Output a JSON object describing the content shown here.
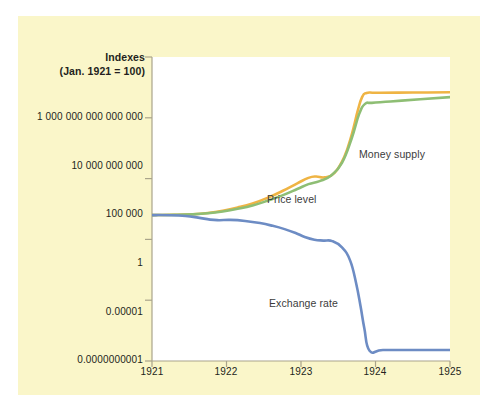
{
  "figure": {
    "background_color": "#ffffff",
    "panel_color": "#faf6c9",
    "plot_color": "#ffffff"
  },
  "axis_title": {
    "line1": "Indexes",
    "line2": "(Jan. 1921 = 100)"
  },
  "chart_data": {
    "type": "line",
    "title": "Indexes (Jan. 1921 = 100)",
    "xlabel": "",
    "ylabel": "Indexes (Jan. 1921 = 100)",
    "yscale": "log",
    "grid": false,
    "legend": "inline-annotations",
    "xlim": [
      1921,
      1925
    ],
    "ylim": [
      1e-10,
      1000000000000000.0
    ],
    "xticks": [
      1921,
      1922,
      1923,
      1924,
      1925
    ],
    "xtick_labels": [
      "1921",
      "1922",
      "1923",
      "1924",
      "1925"
    ],
    "yticks": [
      1000000000000000.0,
      10000000000.0,
      100000.0,
      1,
      1e-05,
      1e-10
    ],
    "ytick_labels": [
      "1 000 000 000 000 000",
      "10 000 000 000",
      "100 000",
      "1",
      "0.00001",
      "0.0000000001"
    ],
    "series": [
      {
        "name": "Price level",
        "color": "#efb444",
        "x": [
          1921.0,
          1921.3,
          1921.55,
          1921.75,
          1921.95,
          1922.15,
          1922.35,
          1922.55,
          1922.75,
          1922.95,
          1923.1,
          1923.2,
          1923.32,
          1923.45,
          1923.58,
          1923.68,
          1923.76,
          1923.82,
          1923.88,
          1924.0,
          1924.3,
          1924.7,
          1925.0
        ],
        "values": [
          100,
          105,
          118,
          150,
          230,
          420,
          900,
          2600,
          9500,
          41000,
          115000,
          150000,
          128000,
          300000,
          6000000.0,
          400000000.0,
          35000000000.0,
          500000000000.0,
          1100000000000.0,
          1150000000000.0,
          1180000000000.0,
          1200000000000.0,
          1250000000000.0
        ]
      },
      {
        "name": "Money supply",
        "color": "#8ebe74",
        "x": [
          1921.0,
          1921.3,
          1921.55,
          1921.75,
          1921.95,
          1922.15,
          1922.35,
          1922.55,
          1922.75,
          1922.95,
          1923.1,
          1923.25,
          1923.4,
          1923.55,
          1923.68,
          1923.78,
          1923.86,
          1923.95,
          1924.2,
          1924.6,
          1925.0
        ],
        "values": [
          100,
          104,
          115,
          140,
          200,
          330,
          620,
          1500,
          4200,
          14000,
          35000,
          62000,
          170000,
          2000000.0,
          200000000.0,
          20000000000.0,
          140000000000.0,
          170000000000.0,
          220000000000.0,
          340000000000.0,
          500000000000.0
        ]
      },
      {
        "name": "Exchange rate",
        "color": "#6d8cc4",
        "x": [
          1921.0,
          1921.25,
          1921.45,
          1921.62,
          1921.78,
          1921.9,
          1922.05,
          1922.25,
          1922.45,
          1922.62,
          1922.78,
          1922.92,
          1923.05,
          1923.18,
          1923.3,
          1923.42,
          1923.55,
          1923.66,
          1923.74,
          1923.8,
          1923.85,
          1923.92,
          1924.1,
          1924.5,
          1925.0
        ],
        "values": [
          100,
          98,
          85,
          62,
          42,
          38,
          40,
          33,
          22,
          13,
          7.0,
          3.5,
          1.6,
          0.95,
          0.8,
          0.72,
          0.22,
          0.018,
          0.00025,
          3e-06,
          5e-08,
          7e-10,
          8e-10,
          8e-10,
          8e-10
        ]
      }
    ],
    "annotations": [
      {
        "text": "Price level",
        "x": 1923.05,
        "y": 4000000.0
      },
      {
        "text": "Money supply",
        "x": 1924.25,
        "y": 600000000000.0
      },
      {
        "text": "Exchange rate",
        "x": 1923.08,
        "y": 2e-05
      }
    ]
  },
  "axis_labels": {
    "y": [
      "1 000 000 000 000 000",
      "10 000 000 000",
      "100 000",
      "1",
      "0.00001",
      "0.0000000001"
    ],
    "x": [
      "1921",
      "1922",
      "1923",
      "1924",
      "1925"
    ]
  },
  "series_labels": {
    "price_level": "Price level",
    "money_supply": "Money supply",
    "exchange_rate": "Exchange rate"
  }
}
